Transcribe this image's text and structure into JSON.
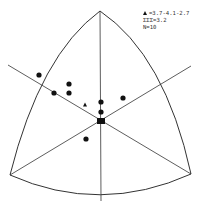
{
  "legend": {
    "mean_symbol": "triangle",
    "mean_label": "=3.7-4.1-2.7",
    "sdi_label": "ΣΣΣ=3.2",
    "n_label": "N=10"
  },
  "diagram": {
    "type": "curved-triangle-plot",
    "vertices": {
      "top": [
        100,
        11
      ],
      "bottom_left": [
        10,
        175
      ],
      "bottom_right": [
        191,
        174
      ]
    },
    "center": [
      101,
      121
    ],
    "colors": {
      "line": "#333333",
      "point": "#111111",
      "background": "#ffffff"
    }
  },
  "points": [
    {
      "x": 39,
      "y": 75,
      "shape": "circle"
    },
    {
      "x": 54,
      "y": 93,
      "shape": "circle"
    },
    {
      "x": 69,
      "y": 84,
      "shape": "circle"
    },
    {
      "x": 69,
      "y": 93,
      "shape": "circle"
    },
    {
      "x": 101,
      "y": 102,
      "shape": "circle"
    },
    {
      "x": 101,
      "y": 112,
      "shape": "circle"
    },
    {
      "x": 123,
      "y": 98,
      "shape": "circle"
    },
    {
      "x": 86,
      "y": 139,
      "shape": "circle"
    },
    {
      "x": 101,
      "y": 121,
      "shape": "square"
    }
  ],
  "mean_marker": {
    "x": 85,
    "y": 105,
    "shape": "triangle"
  }
}
